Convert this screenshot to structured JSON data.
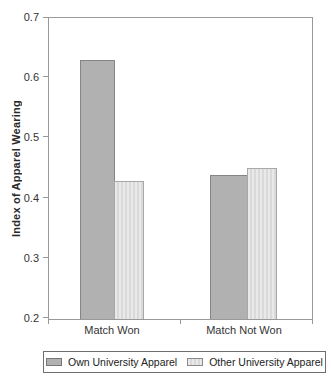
{
  "figure": {
    "background": "#ffffff"
  },
  "chart_data": {
    "type": "bar",
    "title": "",
    "categories": [
      "Match Won",
      "Match Not Won"
    ],
    "series": [
      {
        "name": "Own University Apparel",
        "values": [
          0.63,
          0.44
        ],
        "color": "#b1b1b1",
        "pattern": "solid"
      },
      {
        "name": "Other University Apparel",
        "values": [
          0.43,
          0.45
        ],
        "color": "#e3e3e3",
        "pattern": "vertical-stripes"
      }
    ],
    "xlabel": "",
    "ylabel": "Index of Apparel Wearing",
    "ylim": [
      0.2,
      0.7
    ],
    "yticks": [
      0.7,
      0.6,
      0.5,
      0.4,
      0.3,
      0.2
    ],
    "grid": false,
    "plot_frame": true,
    "legend_position": "bottom",
    "axis_color": "#999999",
    "text_color": "#333333"
  }
}
